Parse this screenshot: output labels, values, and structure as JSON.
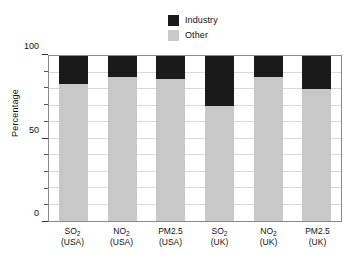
{
  "chart_data": {
    "type": "bar",
    "subtype": "stacked-bar-100-percent",
    "title": "",
    "subtitle": "",
    "xlabel": "",
    "ylabel": "Percentage",
    "ylim": [
      0,
      100
    ],
    "ytick_labels": [
      "0",
      "50",
      "100"
    ],
    "ytick_values": [
      0,
      50,
      100
    ],
    "yminor_step": 10,
    "grid": true,
    "grid_axis": "y",
    "legend_position": "top-center",
    "categories": [
      "SO2 (USA)",
      "NO2 (USA)",
      "PM2.5 (USA)",
      "SO2 (UK)",
      "NO2 (UK)",
      "PM2.5 (UK)"
    ],
    "category_lines": [
      {
        "pollutant": "SO",
        "sub": "2",
        "region": "(USA)"
      },
      {
        "pollutant": "NO",
        "sub": "2",
        "region": "(USA)"
      },
      {
        "pollutant": "PM2.5",
        "sub": "",
        "region": "(USA)"
      },
      {
        "pollutant": "SO",
        "sub": "2",
        "region": "(UK)"
      },
      {
        "pollutant": "NO",
        "sub": "2",
        "region": "(UK)"
      },
      {
        "pollutant": "PM2.5",
        "sub": "",
        "region": "(UK)"
      }
    ],
    "series": [
      {
        "name": "Industry",
        "color": "#1a1a1a",
        "values": [
          17,
          13,
          14,
          30,
          13,
          20
        ]
      },
      {
        "name": "Other",
        "color": "#c8c8c8",
        "values": [
          83,
          87,
          86,
          70,
          87,
          80
        ]
      }
    ],
    "stack_order": [
      "Other",
      "Industry"
    ]
  },
  "legend": {
    "items": [
      {
        "label": "Industry",
        "color": "#1a1a1a"
      },
      {
        "label": "Other",
        "color": "#c8c8c8"
      }
    ]
  },
  "axes": {
    "y_title": "Percentage"
  },
  "colors": {
    "industry": "#1a1a1a",
    "other": "#c8c8c8",
    "grid": "#d9d9d9",
    "frame": "#8a8a8a",
    "text": "#111111",
    "background": "#ffffff"
  }
}
